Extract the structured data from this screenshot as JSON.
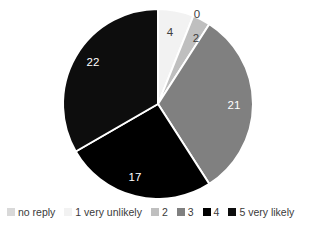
{
  "chart_data": {
    "type": "pie",
    "title": "",
    "subtitle": "",
    "xlabel": "",
    "ylabel": "",
    "total": 66,
    "start_angle_deg": 0,
    "direction": "clockwise",
    "grid": false,
    "legend_position": "bottom",
    "labels_inside": true,
    "categories": [
      "no reply",
      "1 very unlikely",
      "2",
      "3",
      "4",
      "5 very likely"
    ],
    "values": [
      0,
      4,
      2,
      21,
      17,
      22
    ],
    "colors": [
      "#D9D9D9",
      "#F2F2F2",
      "#BFBFBF",
      "#808080",
      "#000000",
      "#0D0D0D"
    ],
    "slices": [
      {
        "name": "no reply",
        "value": 0,
        "label": "0",
        "color": "#D9D9D9",
        "label_color": "#404040",
        "label_x": 197,
        "label_y": 18,
        "visible": false
      },
      {
        "name": "1 very unlikely",
        "value": 4,
        "label": "4",
        "color": "#F2F2F2",
        "label_color": "#404040",
        "label_x": 170,
        "label_y": 36,
        "visible": true
      },
      {
        "name": "2",
        "value": 2,
        "label": "2",
        "color": "#BFBFBF",
        "label_color": "#404040",
        "label_x": 196,
        "label_y": 42,
        "visible": true
      },
      {
        "name": "3",
        "value": 21,
        "label": "21",
        "color": "#808080",
        "label_color": "#FFFFFF",
        "label_x": 234,
        "label_y": 109,
        "visible": true
      },
      {
        "name": "4",
        "value": 17,
        "label": "17",
        "color": "#000000",
        "label_color": "#FFFFFF",
        "label_x": 135,
        "label_y": 181,
        "visible": true
      },
      {
        "name": "5 very likely",
        "value": 22,
        "label": "22",
        "color": "#0D0D0D",
        "label_color": "#FFFFFF",
        "label_x": 93,
        "label_y": 66,
        "visible": true
      }
    ],
    "geometry": {
      "center_x": 158,
      "center_y": 104,
      "radius": 95,
      "separator_color": "#FFFFFF",
      "separator_width": 2
    }
  },
  "legend": {
    "items": [
      {
        "label": "no reply",
        "color": "#D9D9D9"
      },
      {
        "label": "1 very unlikely",
        "color": "#F2F2F2"
      },
      {
        "label": "2",
        "color": "#BFBFBF"
      },
      {
        "label": "3",
        "color": "#808080"
      },
      {
        "label": "4",
        "color": "#000000"
      },
      {
        "label": "5 very likely",
        "color": "#0D0D0D"
      }
    ]
  }
}
